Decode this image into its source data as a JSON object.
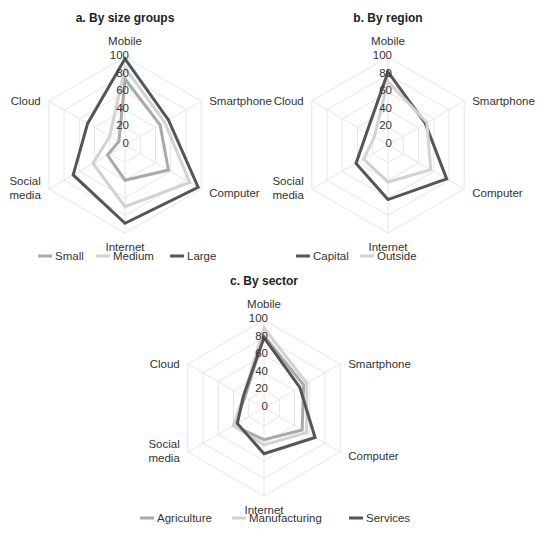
{
  "chart_data": [
    {
      "type": "radar",
      "title": "a. By size groups",
      "axes": [
        "Mobile",
        "Smartphone",
        "Computer",
        "Internet",
        "Social media",
        "Cloud"
      ],
      "ticks": [
        "0",
        "20",
        "40",
        "60",
        "80",
        "100"
      ],
      "range": [
        0,
        100
      ],
      "series": [
        {
          "name": "Small",
          "color": "#a9a9a9",
          "values": [
            75,
            46,
            57,
            40,
            23,
            8
          ]
        },
        {
          "name": "Medium",
          "color": "#d2d2d2",
          "values": [
            88,
            52,
            85,
            70,
            42,
            20
          ]
        },
        {
          "name": "Large",
          "color": "#555555",
          "values": [
            98,
            57,
            96,
            89,
            68,
            49
          ]
        }
      ],
      "legend_position": "bottom"
    },
    {
      "type": "radar",
      "title": "b. By region",
      "axes": [
        "Mobile",
        "Smartphone",
        "Computer",
        "Internet",
        "Social media",
        "Cloud"
      ],
      "ticks": [
        "0",
        "20",
        "40",
        "60",
        "80",
        "100"
      ],
      "range": [
        0,
        100
      ],
      "series": [
        {
          "name": "Capital",
          "color": "#555555",
          "values": [
            83,
            49,
            77,
            62,
            42,
            28
          ]
        },
        {
          "name": "Outside",
          "color": "#d2d2d2",
          "values": [
            72,
            51,
            56,
            42,
            32,
            18
          ]
        }
      ],
      "legend_position": "bottom"
    },
    {
      "type": "radar",
      "title": "c. By sector",
      "axes": [
        "Mobile",
        "Smartphone",
        "Computer",
        "Internet",
        "Social media",
        "Cloud"
      ],
      "ticks": [
        "0",
        "20",
        "40",
        "60",
        "80",
        "100"
      ],
      "range": [
        0,
        100
      ],
      "series": [
        {
          "name": "Agriculture",
          "color": "#a9a9a9",
          "values": [
            82,
            52,
            50,
            36,
            40,
            25
          ]
        },
        {
          "name": "Manufacturing",
          "color": "#d2d2d2",
          "values": [
            91,
            56,
            56,
            42,
            40,
            27
          ]
        },
        {
          "name": "Services",
          "color": "#555555",
          "values": [
            80,
            47,
            67,
            52,
            35,
            27
          ]
        }
      ],
      "legend_position": "bottom"
    }
  ],
  "layout": [
    {
      "cx": 125,
      "cy": 145,
      "r": 88,
      "title_y": 22,
      "legend_y": 256,
      "legend_x": [
        38,
        96,
        170
      ]
    },
    {
      "cx": 388,
      "cy": 145,
      "r": 88,
      "title_y": 22,
      "legend_y": 256,
      "legend_x": [
        296,
        360
      ]
    },
    {
      "cx": 264,
      "cy": 408,
      "r": 88,
      "title_y": 285,
      "legend_y": 518,
      "legend_x": [
        140,
        232,
        349
      ]
    }
  ]
}
